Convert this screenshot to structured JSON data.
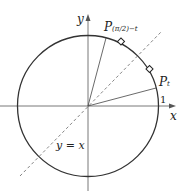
{
  "diagram": {
    "axis_x_label": "x",
    "axis_y_label": "y",
    "tick_one": "1",
    "line_label": "y = x",
    "point_t": {
      "main": "P",
      "sub": "t"
    },
    "point_comp": {
      "main": "P",
      "sub": "(π/2)−t"
    },
    "colors": {
      "stroke": "#333333",
      "axis": "#555555",
      "dash": "#666666"
    }
  }
}
